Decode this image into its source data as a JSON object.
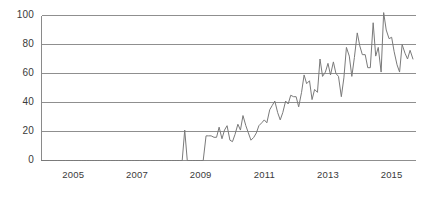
{
  "chart_data": {
    "type": "line",
    "title": "",
    "subtitle": "",
    "xlabel": "",
    "ylabel": "",
    "xlim": [
      2004.0,
      2015.75
    ],
    "ylim": [
      0,
      100
    ],
    "grid": "horizontal",
    "legend": null,
    "line_color": "#7a7a7a",
    "axis_color": "#8a8a8a",
    "grid_color": "#8f8f8f",
    "label_color": "#3a3a3a",
    "y_ticks": [
      0,
      20,
      40,
      60,
      80,
      100
    ],
    "y_tick_labels": [
      "0",
      "20",
      "40",
      "60",
      "80",
      "100"
    ],
    "x_ticks": [
      2005,
      2007,
      2009,
      2011,
      2013,
      2015
    ],
    "x_tick_labels": [
      "2005",
      "2007",
      "2009",
      "2011",
      "2013",
      "2015"
    ],
    "series": [
      {
        "name": "interest-over-time",
        "x": [
          2004.0,
          2004.08,
          2004.17,
          2004.25,
          2004.33,
          2004.42,
          2004.5,
          2004.58,
          2004.67,
          2004.75,
          2004.83,
          2004.92,
          2005.0,
          2005.08,
          2005.17,
          2005.25,
          2005.33,
          2005.42,
          2005.5,
          2005.58,
          2005.67,
          2005.75,
          2005.83,
          2005.92,
          2006.0,
          2006.08,
          2006.17,
          2006.25,
          2006.33,
          2006.42,
          2006.5,
          2006.58,
          2006.67,
          2006.75,
          2006.83,
          2006.92,
          2007.0,
          2007.08,
          2007.17,
          2007.25,
          2007.33,
          2007.42,
          2007.5,
          2007.58,
          2007.67,
          2007.75,
          2007.83,
          2007.92,
          2008.0,
          2008.08,
          2008.17,
          2008.25,
          2008.33,
          2008.42,
          2008.5,
          2008.58,
          2008.67,
          2008.75,
          2008.83,
          2008.92,
          2009.0,
          2009.08,
          2009.17,
          2009.25,
          2009.33,
          2009.42,
          2009.5,
          2009.58,
          2009.67,
          2009.75,
          2009.83,
          2009.92,
          2010.0,
          2010.08,
          2010.17,
          2010.25,
          2010.33,
          2010.42,
          2010.5,
          2010.58,
          2010.67,
          2010.75,
          2010.83,
          2010.92,
          2011.0,
          2011.08,
          2011.17,
          2011.25,
          2011.33,
          2011.42,
          2011.5,
          2011.58,
          2011.67,
          2011.75,
          2011.83,
          2011.92,
          2012.0,
          2012.08,
          2012.17,
          2012.25,
          2012.33,
          2012.42,
          2012.5,
          2012.58,
          2012.67,
          2012.75,
          2012.83,
          2012.92,
          2013.0,
          2013.08,
          2013.17,
          2013.25,
          2013.33,
          2013.42,
          2013.5,
          2013.58,
          2013.67,
          2013.75,
          2013.83,
          2013.92,
          2014.0,
          2014.08,
          2014.17,
          2014.25,
          2014.33,
          2014.42,
          2014.5,
          2014.58,
          2014.67,
          2014.75,
          2014.83,
          2014.92,
          2015.0,
          2015.08,
          2015.17,
          2015.25,
          2015.33,
          2015.42,
          2015.5,
          2015.58,
          2015.67
        ],
        "y": [
          0,
          0,
          0,
          0,
          0,
          0,
          0,
          0,
          0,
          0,
          0,
          0,
          0,
          0,
          0,
          0,
          0,
          0,
          0,
          0,
          0,
          0,
          0,
          0,
          0,
          0,
          0,
          0,
          0,
          0,
          0,
          0,
          0,
          0,
          0,
          0,
          0,
          0,
          0,
          0,
          0,
          0,
          0,
          0,
          0,
          0,
          0,
          0,
          0,
          0,
          0,
          0,
          0,
          0,
          21,
          0,
          0,
          0,
          0,
          0,
          0,
          0,
          17,
          17,
          17,
          16,
          16,
          23,
          15,
          21,
          24,
          14,
          13,
          18,
          25,
          21,
          31,
          24,
          19,
          14,
          16,
          19,
          24,
          26,
          28,
          26,
          35,
          38,
          41,
          33,
          28,
          33,
          41,
          39,
          45,
          44,
          44,
          37,
          47,
          59,
          53,
          55,
          42,
          49,
          47,
          70,
          58,
          61,
          67,
          59,
          68,
          60,
          58,
          44,
          57,
          78,
          72,
          58,
          71,
          88,
          79,
          73,
          73,
          64,
          64,
          95,
          72,
          78,
          61,
          102,
          90,
          84,
          85,
          75,
          66,
          61,
          80,
          74,
          70,
          76,
          70
        ]
      }
    ]
  }
}
